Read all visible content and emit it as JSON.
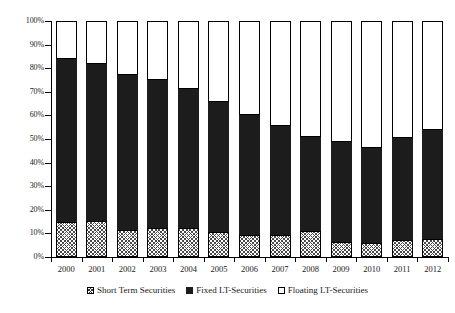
{
  "chart_data": {
    "type": "bar",
    "subtype": "stacked-100-percent",
    "title": "",
    "subtitle": "",
    "xlabel": "",
    "ylabel": "",
    "categories": [
      "2000",
      "2001",
      "2002",
      "2003",
      "2004",
      "2005",
      "2006",
      "2007",
      "2008",
      "2009",
      "2010",
      "2011",
      "2012"
    ],
    "ylim": [
      0,
      100
    ],
    "ytick_values": [
      0,
      10,
      20,
      30,
      40,
      50,
      60,
      70,
      80,
      90,
      100
    ],
    "ytick_labels": [
      "0%",
      "10%",
      "20%",
      "30%",
      "40%",
      "50%",
      "60%",
      "70%",
      "80%",
      "90%",
      "100%"
    ],
    "grid": false,
    "legend_position": "bottom",
    "series": [
      {
        "name": "Short Term Securities",
        "fill": "hatched",
        "values": [
          14.7,
          15.3,
          11.4,
          12.2,
          12.1,
          10.7,
          9.4,
          9.2,
          11.0,
          6.3,
          6.0,
          7.2,
          7.6
        ]
      },
      {
        "name": "Fixed LT-Securities",
        "fill": "solid-black",
        "values": [
          69.2,
          66.3,
          65.9,
          62.8,
          59.2,
          55.1,
          50.9,
          46.5,
          40.0,
          42.4,
          40.4,
          43.3,
          46.4
        ]
      },
      {
        "name": "Floating LT-Securities",
        "fill": "white",
        "values": [
          16.1,
          18.4,
          22.7,
          25.0,
          28.7,
          34.2,
          39.7,
          44.3,
          49.0,
          51.3,
          53.6,
          49.5,
          46.0
        ]
      }
    ],
    "stack_tops": {
      "short_term": [
        14.7,
        15.3,
        11.4,
        12.2,
        12.1,
        10.7,
        9.4,
        9.2,
        11.0,
        6.3,
        6.0,
        7.2,
        7.6
      ],
      "short_plus_fixed": [
        83.9,
        81.6,
        77.3,
        75.0,
        71.3,
        65.8,
        60.3,
        55.7,
        51.0,
        48.7,
        46.4,
        50.5,
        54.0
      ],
      "total": [
        100,
        100,
        100,
        100,
        100,
        100,
        100,
        100,
        100,
        100,
        100,
        100,
        100
      ]
    }
  },
  "legend": {
    "items": [
      {
        "label": "Short Term Securities",
        "swatch": "hatched-square-icon"
      },
      {
        "label": "Fixed LT-Securities",
        "swatch": "filled-black-square-icon"
      },
      {
        "label": "Floating LT-Securities",
        "swatch": "empty-square-icon"
      }
    ]
  },
  "colors": {
    "fixed": "#1c1c1c",
    "floating": "#ffffff",
    "short_term_hatch": "#4a4a4a",
    "axis": "#000000",
    "text": "#1a1a1a",
    "background": "#ffffff"
  }
}
